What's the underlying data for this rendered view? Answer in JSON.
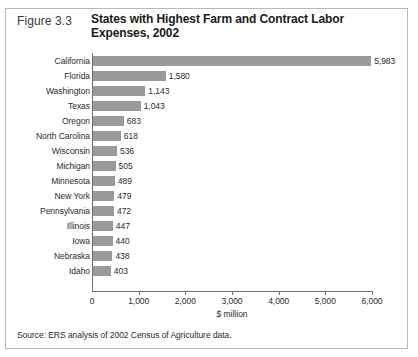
{
  "figure": {
    "number_label": "Figure 3.3",
    "title": "States with Highest Farm and Contract Labor Expenses, 2002",
    "source": "Source: ERS analysis of 2002 Census of Agriculture data."
  },
  "colors": {
    "bar": "#9a9a9a",
    "axis": "#6f6f6f",
    "frame_border": "#b9b9b9",
    "text": "#2b2b2b",
    "title_text": "#1a1a1a"
  },
  "chart_data": {
    "type": "bar",
    "orientation": "horizontal",
    "title": "States with Highest Farm and Contract Labor Expenses, 2002",
    "subtitle": "",
    "xlabel": "$ million",
    "ylabel": "",
    "xlim": [
      0,
      6000
    ],
    "xticks": [
      0,
      1000,
      2000,
      3000,
      4000,
      5000,
      6000
    ],
    "xtick_labels": [
      "0",
      "1,000",
      "2,000",
      "3,000",
      "4,000",
      "5,000",
      "6,000"
    ],
    "grid": false,
    "legend": false,
    "legend_position": "none",
    "data_labels": true,
    "categories": [
      "California",
      "Florida",
      "Washington",
      "Texas",
      "Oregon",
      "North Carolina",
      "Wisconsin",
      "Michigan",
      "Minnesota",
      "New York",
      "Pennsylvania",
      "Illinois",
      "Iowa",
      "Nebraska",
      "Idaho"
    ],
    "values": [
      5983,
      1580,
      1143,
      1043,
      683,
      618,
      536,
      505,
      489,
      479,
      472,
      447,
      440,
      438,
      403
    ],
    "value_labels": [
      "5,983",
      "1,580",
      "1,143",
      "1,043",
      "683",
      "618",
      "536",
      "505",
      "489",
      "479",
      "472",
      "447",
      "440",
      "438",
      "403"
    ]
  }
}
